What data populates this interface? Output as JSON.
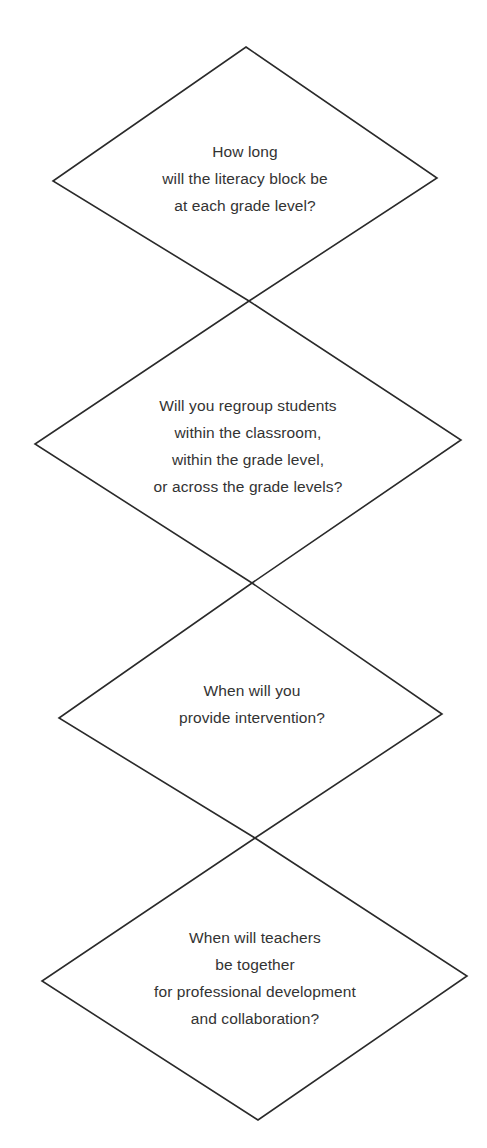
{
  "diagram": {
    "type": "flowchart-decision-chain",
    "stroke_color": "#2a2a2a",
    "text_color": "#333333",
    "background": "#ffffff",
    "nodes": [
      {
        "id": "d1",
        "shape": "diamond",
        "vertices": {
          "top": [
            246,
            47
          ],
          "left": [
            53,
            181
          ],
          "right": [
            437,
            178
          ],
          "bottom": [
            249,
            301
          ]
        },
        "center": [
          245,
          178
        ],
        "lines": [
          "How long",
          "will the literacy block be",
          "at each grade level?"
        ]
      },
      {
        "id": "d2",
        "shape": "diamond",
        "vertices": {
          "top": [
            249,
            301
          ],
          "left": [
            35,
            444
          ],
          "right": [
            461,
            440
          ],
          "bottom": [
            252,
            583
          ]
        },
        "center": [
          248,
          446
        ],
        "lines": [
          "Will you regroup students",
          "within the classroom,",
          "within the grade level,",
          "or across the grade levels?"
        ]
      },
      {
        "id": "d3",
        "shape": "diamond",
        "vertices": {
          "top": [
            252,
            583
          ],
          "left": [
            59,
            718
          ],
          "right": [
            442,
            714
          ],
          "bottom": [
            255,
            838
          ]
        },
        "center": [
          252,
          704
        ],
        "lines": [
          "When will you",
          "provide intervention?"
        ]
      },
      {
        "id": "d4",
        "shape": "diamond",
        "vertices": {
          "top": [
            255,
            838
          ],
          "left": [
            42,
            981
          ],
          "right": [
            467,
            976
          ],
          "bottom": [
            258,
            1120
          ]
        },
        "center": [
          255,
          978
        ],
        "lines": [
          "When will teachers",
          "be together",
          "for professional development",
          "and collaboration?"
        ]
      }
    ]
  }
}
